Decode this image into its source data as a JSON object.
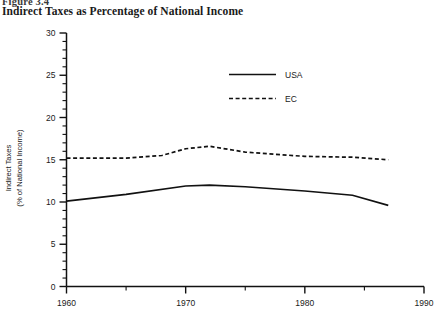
{
  "figure": {
    "figure_label": "Figure 3.4",
    "title": "Indirect Taxes as Percentage of National Income"
  },
  "chart_data": {
    "type": "line",
    "title": "Indirect Taxes as Percentage of National Income",
    "xlabel": "",
    "ylabel": "Indirect Taxes\n(% of National Income)",
    "ylabel_line1": "Indirect Taxes",
    "ylabel_line2": "(% of National Income)",
    "xlim": [
      1960,
      1990
    ],
    "ylim": [
      0,
      30
    ],
    "y_ticks": [
      0,
      5,
      10,
      15,
      20,
      25,
      30
    ],
    "y_tick_labels": [
      "0",
      "5",
      "10",
      "15",
      "20",
      "25",
      "30"
    ],
    "y_minor_step": 1,
    "x_ticks": [
      1960,
      1965,
      1970,
      1975,
      1980,
      1985,
      1990
    ],
    "x_tick_labels": [
      "1960",
      "",
      "1970",
      "",
      "1980",
      "",
      "1990"
    ],
    "grid": false,
    "legend_position": "upper-center",
    "series": [
      {
        "name": "USA",
        "style": "solid",
        "color": "#111111",
        "x": [
          1960,
          1965,
          1970,
          1972,
          1975,
          1980,
          1984,
          1987
        ],
        "values": [
          10.1,
          10.9,
          11.9,
          12.0,
          11.8,
          11.3,
          10.8,
          9.6
        ]
      },
      {
        "name": "EC",
        "style": "dashed",
        "color": "#111111",
        "x": [
          1960,
          1965,
          1968,
          1970,
          1972,
          1975,
          1980,
          1984,
          1987
        ],
        "values": [
          15.2,
          15.2,
          15.5,
          16.3,
          16.6,
          15.9,
          15.4,
          15.3,
          15.0
        ]
      }
    ]
  },
  "legend": {
    "entries": [
      {
        "label": "USA",
        "style": "solid"
      },
      {
        "label": "EC",
        "style": "dashed"
      }
    ]
  }
}
